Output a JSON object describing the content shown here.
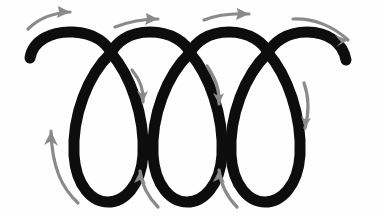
{
  "figure": {
    "background_color": "#fefefe",
    "width": 385,
    "height": 216
  },
  "curve": {
    "name": "coil-loop-curve",
    "color": "#0d0d0d",
    "stroke_width": 11,
    "loop_count": 3,
    "arch_count": 3,
    "path": "M 30 58 C 33 40, 52 31, 73 32 C 96 33, 107 44, 111 53 C 116 43, 128 32, 150 32 C 172 32, 186 43, 190 53 C 195 43, 207 32, 229 32 C 250 32, 264 43, 268 53 C 273 43, 286 32, 307 32 C 328 32, 343 43, 346 60",
    "loops": [
      {
        "name": "loop-1",
        "center_x": 107,
        "top_y": 50,
        "bottom_y": 200,
        "left_x": 72,
        "right_x": 143,
        "path": "M 111 53 C 88 75, 72 115, 74 155 C 76 186, 92 202, 108 202 C 124 202, 141 186, 143 155 C 145 115, 130 75, 111 53"
      },
      {
        "name": "loop-2",
        "center_x": 186,
        "top_y": 50,
        "bottom_y": 200,
        "left_x": 150,
        "right_x": 222,
        "path": "M 190 53 C 167 75, 151 115, 153 155 C 155 186, 171 202, 187 202 C 203 202, 220 186, 222 155 C 224 115, 209 75, 190 53"
      },
      {
        "name": "loop-3",
        "center_x": 265,
        "top_y": 50,
        "bottom_y": 200,
        "left_x": 228,
        "right_x": 300,
        "path": "M 268 53 C 245 75, 229 115, 231 155 C 233 186, 249 202, 265 202 C 281 202, 298 186, 300 155 C 302 115, 287 75, 268 53"
      }
    ]
  },
  "arrows": {
    "color": "#8a8a8a",
    "stroke_width": 3.2,
    "items": [
      {
        "name": "arrow-top-1",
        "direction": "right",
        "position": "above-arch-1",
        "path": "M 28 29 C 38 19, 52 13, 70 12",
        "head_points": "70,12 58,6 59,12 57,18"
      },
      {
        "name": "arrow-top-2",
        "direction": "right",
        "position": "above-arch-2",
        "path": "M 115 27 C 128 22, 142 19, 158 19",
        "head_points": "158,19 146,13 147,19 145,25"
      },
      {
        "name": "arrow-top-3",
        "direction": "right",
        "position": "above-arch-3",
        "path": "M 204 20 C 217 15, 232 13, 249 14",
        "head_points": "249,14 237,8 238,14 236,20"
      },
      {
        "name": "arrow-top-4",
        "direction": "down-right",
        "position": "above-final-arch",
        "path": "M 293 19 C 313 18, 333 26, 348 40",
        "head_points": "348,40 335,35 341,42, 336,47"
      },
      {
        "name": "arrow-inner-down-1",
        "direction": "down",
        "position": "inside-arch-1-right",
        "path": "M 132 70 C 141 81, 144 92, 143 102",
        "head_points": "143,102 137,91 143,94 148,91"
      },
      {
        "name": "arrow-inner-down-2",
        "direction": "down",
        "position": "inside-arch-2-right",
        "path": "M 207 66 C 216 79, 220 92, 219 104",
        "head_points": "219,104 213,93 219,96 224,93"
      },
      {
        "name": "arrow-inner-down-3",
        "direction": "down",
        "position": "inside-arch-3-right",
        "path": "M 304 83 C 309 97, 309 113, 305 128",
        "head_points": "305,128 301,116 306,120 311,118"
      },
      {
        "name": "arrow-bottom-left-up",
        "direction": "up-left",
        "position": "left-of-loop-1",
        "path": "M 78 203 C 62 188, 52 168, 51 131",
        "head_points": "51,131 44,145 51,141 58,146"
      },
      {
        "name": "arrow-bottom-up-1",
        "direction": "up-left",
        "position": "between-loop-1-and-2",
        "path": "M 158 207 C 148 197, 142 186, 140 171",
        "head_points": "140,171 134,183 140,180 146,184"
      },
      {
        "name": "arrow-bottom-up-2",
        "direction": "up-left",
        "position": "between-loop-2-and-3",
        "path": "M 237 207 C 227 197, 221 186, 219 170",
        "head_points": "219,170 213,182 219,179 225,183"
      }
    ]
  }
}
